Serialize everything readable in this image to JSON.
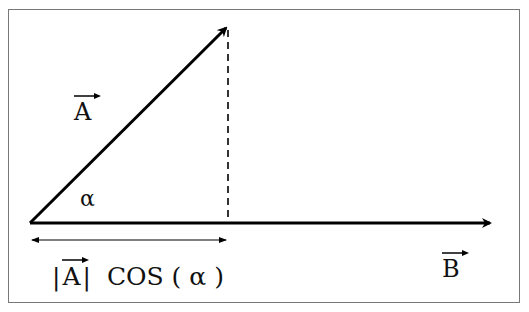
{
  "diagram": {
    "type": "vector-projection",
    "vector_a": {
      "label": "A",
      "from": [
        30,
        223
      ],
      "to": [
        229,
        25
      ]
    },
    "vector_b": {
      "label": "B",
      "from": [
        30,
        223
      ],
      "to": [
        492,
        223
      ]
    },
    "angle_label": "α",
    "projection_label": {
      "abs_open": "|",
      "vec": "A",
      "abs_close": "|",
      "func": "COS",
      "paren_open": "(",
      "arg": "α",
      "paren_close": ")"
    },
    "colors": {
      "line": "#000000",
      "frame": "#777777",
      "background": "#ffffff"
    }
  }
}
